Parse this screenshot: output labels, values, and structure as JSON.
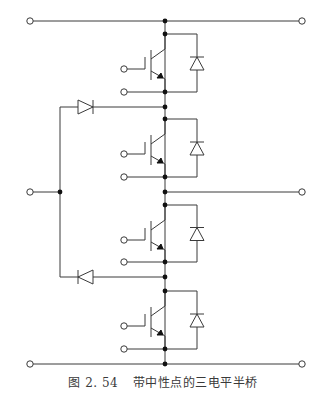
{
  "figure": {
    "number": "图 2. 54",
    "title": "带中性点的三电平半桥"
  },
  "diagram": {
    "type": "circuit-schematic",
    "colors": {
      "wire": "#3a3a3a",
      "node": "#111111",
      "terminal_fill": "#ffffff"
    },
    "rails": [
      {
        "name": "positive-dc-rail",
        "y": 21
      },
      {
        "name": "ac-output",
        "y": 192
      },
      {
        "name": "negative-dc-rail",
        "y": 364
      }
    ],
    "neutral_terminal": {
      "x": 30,
      "y": 192
    },
    "switches": [
      {
        "name": "igbt-1",
        "top_y": 34,
        "gate_y": 69,
        "emitter_y": 92
      },
      {
        "name": "igbt-2",
        "top_y": 119,
        "gate_y": 154,
        "emitter_y": 177
      },
      {
        "name": "igbt-3",
        "top_y": 205,
        "gate_y": 240,
        "emitter_y": 262
      },
      {
        "name": "igbt-4",
        "top_y": 291,
        "gate_y": 326,
        "emitter_y": 349
      }
    ],
    "clamp_diodes": [
      {
        "name": "upper-clamp-diode",
        "y": 107,
        "direction": "right"
      },
      {
        "name": "lower-clamp-diode",
        "y": 277,
        "direction": "left"
      }
    ]
  }
}
